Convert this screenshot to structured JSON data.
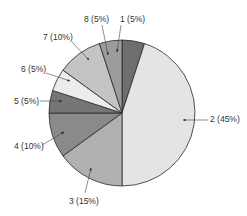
{
  "chart_data": {
    "type": "pie",
    "title": "",
    "categories": [
      "1",
      "2",
      "3",
      "4",
      "5",
      "6",
      "7",
      "8"
    ],
    "values": [
      5,
      45,
      15,
      10,
      5,
      5,
      10,
      5
    ],
    "labels": [
      "1 (5%)",
      "2 (45%)",
      "3 (15%)",
      "4 (10%)",
      "5 (5%)",
      "6 (5%)",
      "7 (10%)",
      "8 (5%)"
    ],
    "colors": [
      "#6e6e6e",
      "#e4e4e4",
      "#b0b0b0",
      "#8a8a8a",
      "#767676",
      "#ececec",
      "#c4c4c4",
      "#9c9c9c"
    ],
    "start_angle_deg": 0,
    "direction": "clockwise",
    "legend": "none",
    "label_style": "callout with arrow"
  },
  "geometry": {
    "cx": 122,
    "cy": 113,
    "r": 73
  },
  "label_positions": [
    {
      "x": 120,
      "y": 22,
      "ax": 117,
      "ay": 52,
      "lx1": 121,
      "ly1": 25
    },
    {
      "x": 210,
      "y": 122,
      "ax": 183,
      "ay": 120,
      "lx1": 208,
      "ly1": 120
    },
    {
      "x": 69,
      "y": 204,
      "ax": 91,
      "ay": 168,
      "lx1": 85,
      "ly1": 193
    },
    {
      "x": 14,
      "y": 149,
      "ax": 64,
      "ay": 132,
      "lx1": 42,
      "ly1": 145
    },
    {
      "x": 14,
      "y": 104,
      "ax": 62,
      "ay": 101,
      "lx1": 40,
      "ly1": 101
    },
    {
      "x": 21,
      "y": 72,
      "ax": 70,
      "ay": 81,
      "lx1": 46,
      "ly1": 73
    },
    {
      "x": 43,
      "y": 40,
      "ax": 89,
      "ay": 60,
      "lx1": 72,
      "ly1": 42
    },
    {
      "x": 84,
      "y": 22,
      "ax": 108,
      "ay": 55,
      "lx1": 102,
      "ly1": 25
    }
  ]
}
